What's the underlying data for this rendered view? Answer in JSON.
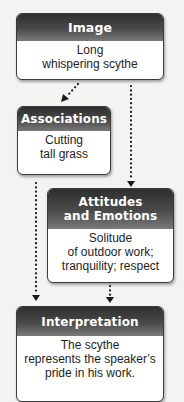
{
  "diagram": {
    "type": "flowchart",
    "background": "#f3f3f2",
    "header_color": "#3a3a3a",
    "nodes": [
      {
        "id": "image",
        "title_lines": [
          "Image"
        ],
        "body_lines": [
          "Long",
          "whispering scythe"
        ]
      },
      {
        "id": "associations",
        "title_lines": [
          "Associations"
        ],
        "body_lines": [
          "Cutting",
          "tall grass"
        ]
      },
      {
        "id": "attitudes",
        "title_lines": [
          "Attitudes",
          "and Emotions"
        ],
        "body_lines": [
          "Solitude",
          "of outdoor work;",
          "tranquility; respect"
        ]
      },
      {
        "id": "interpretation",
        "title_lines": [
          "Interpretation"
        ],
        "body_lines": [
          "The scythe",
          "represents the speaker’s",
          "pride in his work."
        ]
      }
    ],
    "edges": [
      {
        "from": "image",
        "to": "associations",
        "style": "dotted-arrow"
      },
      {
        "from": "image",
        "to": "attitudes",
        "style": "dotted-arrow"
      },
      {
        "from": "associations",
        "to": "interpretation",
        "style": "dotted-arrow"
      },
      {
        "from": "attitudes",
        "to": "interpretation",
        "style": "dotted-arrow"
      }
    ]
  }
}
